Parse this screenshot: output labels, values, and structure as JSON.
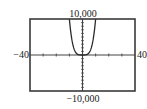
{
  "chart_data": {
    "type": "line",
    "title": "",
    "xlabel": "",
    "ylabel": "",
    "xlim": [
      -40,
      40
    ],
    "ylim": [
      -10000,
      10000
    ],
    "x_scale": 10,
    "y_scale": 1000,
    "grid": false,
    "tick_labels": {
      "xmin": "−40",
      "xmax": "40",
      "ymin": "−10,000",
      "ymax": "10,000"
    },
    "series": [
      {
        "name": "y = x^4",
        "x": [
          -10,
          -9,
          -8,
          -7,
          -6,
          -5,
          -4,
          -3,
          -2,
          -1,
          0,
          1,
          2,
          3,
          4,
          5,
          6,
          7,
          8,
          9,
          10
        ],
        "y": [
          10000,
          6561,
          4096,
          2401,
          1296,
          625,
          256,
          81,
          16,
          1,
          0,
          1,
          16,
          81,
          256,
          625,
          1296,
          2401,
          4096,
          6561,
          10000
        ]
      }
    ]
  },
  "colors": {
    "frame": "#3a3a3a",
    "axis": "#444444",
    "curve": "#2a2a2a",
    "text": "#222222"
  }
}
